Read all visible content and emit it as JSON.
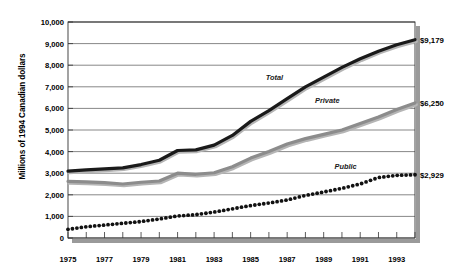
{
  "chart_data": {
    "type": "line",
    "title": "",
    "subtitle": "",
    "xlabel": "",
    "ylabel": "Millions of 1994 Canadian dollars",
    "xlim": [
      1975,
      1994
    ],
    "ylim": [
      0,
      10000
    ],
    "grid": true,
    "legend_position": "inline-series-labels",
    "y_ticks": [
      0,
      1000,
      2000,
      3000,
      4000,
      5000,
      6000,
      7000,
      8000,
      9000,
      10000
    ],
    "y_tick_labels": [
      "0",
      "1,000",
      "2,000",
      "3,000",
      "4,000",
      "5,000",
      "6,000",
      "7,000",
      "8,000",
      "9,000",
      "10,000"
    ],
    "x_ticks": [
      1975,
      1976,
      1977,
      1978,
      1979,
      1980,
      1981,
      1982,
      1983,
      1984,
      1985,
      1986,
      1987,
      1988,
      1989,
      1990,
      1991,
      1992,
      1993,
      1994
    ],
    "x_tick_labels": [
      "1975",
      "1977",
      "1979",
      "1981",
      "1983",
      "1985",
      "1987",
      "1989",
      "1991",
      "1993"
    ],
    "x_labeled_ticks": [
      1975,
      1977,
      1979,
      1981,
      1983,
      1985,
      1987,
      1989,
      1991,
      1993
    ],
    "x": [
      1975,
      1976,
      1977,
      1978,
      1979,
      1980,
      1981,
      1982,
      1983,
      1984,
      1985,
      1986,
      1987,
      1988,
      1989,
      1990,
      1991,
      1992,
      1993,
      1994
    ],
    "series": [
      {
        "name": "Total",
        "style": "solid",
        "color": "#1a1a1a",
        "label": "Total",
        "label_x": 1986.3,
        "label_y": 7450,
        "end_value_label": "$9,179",
        "end_value": 9179,
        "values": [
          3100,
          3150,
          3200,
          3250,
          3400,
          3600,
          4050,
          4080,
          4300,
          4750,
          5400,
          5900,
          6450,
          7000,
          7450,
          7900,
          8300,
          8650,
          8950,
          9179
        ]
      },
      {
        "name": "Private",
        "style": "solid",
        "color": "#8c8c8c",
        "label": "Private",
        "label_x": 1989.2,
        "label_y": 6400,
        "end_value_label": "$6,250",
        "end_value": 6250,
        "values": [
          2620,
          2600,
          2560,
          2500,
          2580,
          2640,
          3000,
          2950,
          3020,
          3300,
          3700,
          4000,
          4350,
          4600,
          4800,
          5000,
          5300,
          5600,
          5950,
          6250
        ]
      },
      {
        "name": "Public",
        "style": "dotted",
        "color": "#111111",
        "label": "Public",
        "label_x": 1990.2,
        "label_y": 3330,
        "end_value_label": "$2,929",
        "end_value": 2929,
        "values": [
          400,
          520,
          600,
          680,
          760,
          880,
          1020,
          1080,
          1200,
          1350,
          1500,
          1620,
          1760,
          1970,
          2130,
          2300,
          2500,
          2800,
          2900,
          2929
        ]
      }
    ]
  }
}
